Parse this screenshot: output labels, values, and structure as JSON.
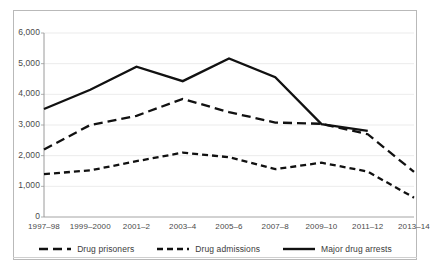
{
  "chart_data": {
    "type": "line",
    "title": "",
    "subtitle": "",
    "xlabel": "",
    "ylabel": "",
    "ylim": [
      0,
      6000
    ],
    "yticks": [
      0,
      1000,
      2000,
      3000,
      4000,
      5000,
      6000
    ],
    "ytick_labels": [
      "0",
      "1,000",
      "2,000",
      "3,000",
      "4,000",
      "5,000",
      "6,000"
    ],
    "grid": true,
    "legend_position": "bottom",
    "categories": [
      "1997–98",
      "1999–2000",
      "2001–2",
      "2003–4",
      "2005–6",
      "2007–8",
      "2009–10",
      "2011–12",
      "2013–14"
    ],
    "series": [
      {
        "name": "Drug prisoners",
        "style": "long-dash",
        "color": "#111111",
        "x": [
          "1997–98",
          "1999–2000",
          "2001–2",
          "2003–4",
          "2005–6",
          "2007–8",
          "2009–10",
          "2011–12",
          "2013–14"
        ],
        "values": [
          2200,
          3000,
          3300,
          3850,
          3420,
          3080,
          3040,
          2700,
          1470
        ]
      },
      {
        "name": "Drug admissions",
        "style": "short-dash",
        "color": "#111111",
        "x": [
          "1997–98",
          "1999–2000",
          "2001–2",
          "2003–4",
          "2005–6",
          "2007–8",
          "2009–10",
          "2011–12",
          "2013–14"
        ],
        "values": [
          1400,
          1520,
          1820,
          2100,
          1950,
          1560,
          1770,
          1480,
          630
        ]
      },
      {
        "name": "Major drug arrests",
        "style": "solid",
        "color": "#111111",
        "x": [
          "1997–98",
          "1999–2000",
          "2001–2",
          "2003–4",
          "2005–6",
          "2007–8",
          "2009–10",
          "2011–12"
        ],
        "values": [
          3520,
          4150,
          4900,
          4430,
          5170,
          4560,
          3030,
          2810
        ]
      }
    ]
  },
  "legend": {
    "items": [
      {
        "label": "Drug prisoners"
      },
      {
        "label": "Drug admissions"
      },
      {
        "label": "Major drug arrests"
      }
    ]
  }
}
